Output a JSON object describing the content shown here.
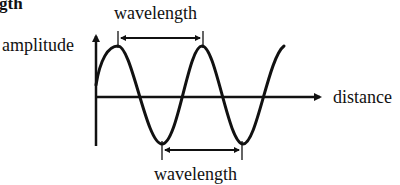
{
  "heading_fragment": "gth",
  "labels": {
    "wavelength_top": "wavelength",
    "amplitude": "amplitude",
    "distance": "distance",
    "wavelength_bottom": "wavelength"
  },
  "diagram": {
    "type": "sine-wave",
    "stroke_color": "#111111",
    "background_color": "#ffffff",
    "y_axis": {
      "label": "amplitude",
      "arrow": "up"
    },
    "x_axis": {
      "label": "distance",
      "arrow": "right"
    },
    "wave": {
      "peaks": 2.5,
      "troughs": 2,
      "starts_at": "above axis, rising"
    },
    "measurements": [
      {
        "label": "wavelength",
        "from": "first crest",
        "to": "second crest",
        "position": "above"
      },
      {
        "label": "wavelength",
        "from": "first trough",
        "to": "second trough",
        "position": "below"
      }
    ]
  }
}
